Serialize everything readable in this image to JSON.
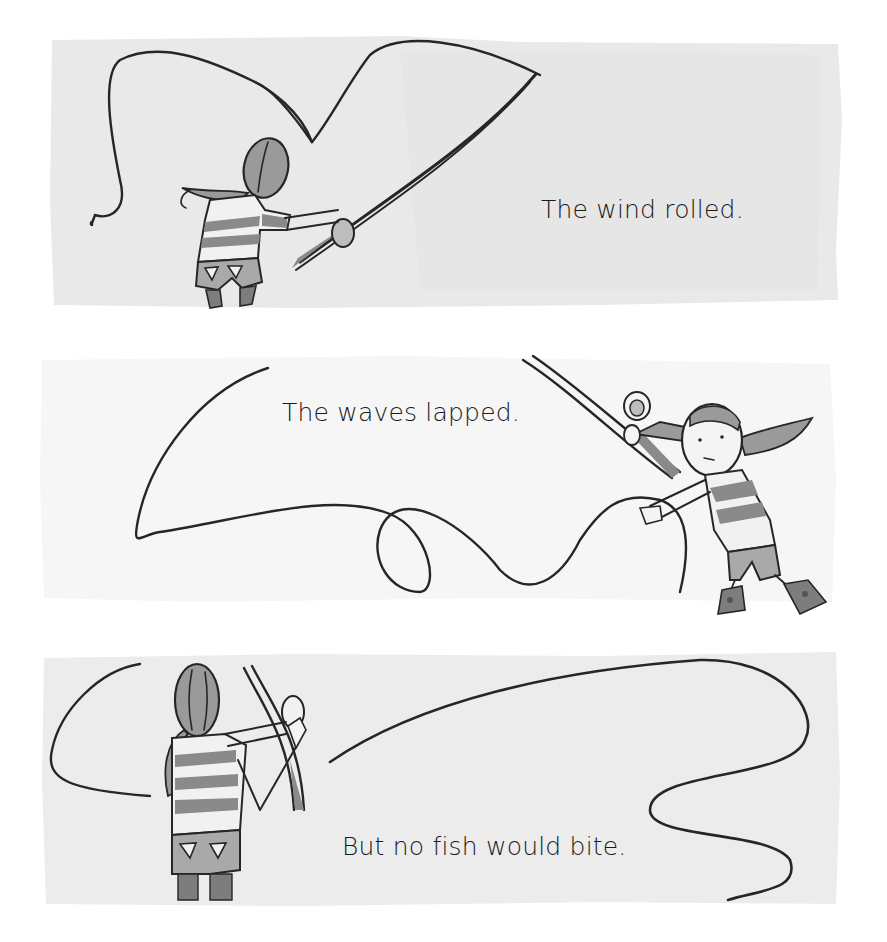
{
  "page": {
    "background": "#ffffff",
    "panels": [
      {
        "id": "panel-1",
        "caption": "The wind rolled.",
        "wash_color": "#e9e9e9",
        "scene": "girl seen from behind casting a fishing line, line looping high overhead to the left"
      },
      {
        "id": "panel-2",
        "caption": "The waves lapped.",
        "wash_color": "#f6f6f6",
        "scene": "girl facing forward holding rod up and reaching for a loose looping line"
      },
      {
        "id": "panel-3",
        "caption": "But no fish would bite.",
        "wash_color": "#ececec",
        "scene": "girl seen from behind holding rod upright, line trailing off to the right"
      }
    ]
  },
  "colors": {
    "ink": "#262626",
    "stripe": "#8a8a8a",
    "hair": "#9a9a9a",
    "skin": "#f4f4f4",
    "shorts": "#a9a9a9",
    "socks": "#7d7d7d",
    "text": "#1a1a1a"
  }
}
